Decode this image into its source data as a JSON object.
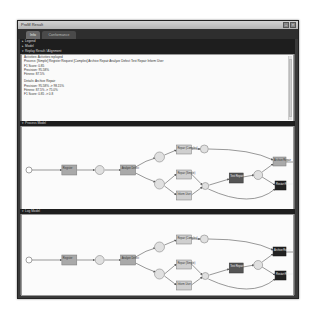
{
  "window": {
    "title": "ProM Result",
    "controls": [
      "minimize",
      "close"
    ]
  },
  "tabs": [
    {
      "label": "Info",
      "active": true
    },
    {
      "label": "Conformance Checking",
      "active": false
    }
  ],
  "sections": {
    "legend": "Legend",
    "model": "Model",
    "report": "Replay Result / Alignment",
    "process_model": "Process Model",
    "log_model": "Log Model"
  },
  "report_lines": [
    "Activities: Activities replayed",
    "Process: [Simple] Register Request [Complex] Archive Repair Analyze Defect Test Repair Inform User",
    "F1 Score: 0.85",
    "Precision: 95.58%",
    "Fitness: 87.5%",
    "",
    "Details: Archive Repair",
    "Precision: 95.58% -> 98.15%",
    "Fitness: 87.5% -> 75.0%",
    "F1 Score: 0.85 -> 0.8"
  ],
  "process_model": {
    "transitions": [
      {
        "id": "t1",
        "label": "Register"
      },
      {
        "id": "t2",
        "label": "Analyze Defect"
      },
      {
        "id": "t3",
        "label": "Repair (Complex)"
      },
      {
        "id": "t4",
        "label": "Repair (Simple)"
      },
      {
        "id": "t5",
        "label": "Inform User"
      },
      {
        "id": "t6",
        "label": "Test Repair"
      },
      {
        "id": "t7",
        "label": "Archive Repair"
      },
      {
        "id": "t8",
        "label": "Restart Repair"
      }
    ]
  },
  "log_model": {
    "transitions": [
      {
        "id": "t1",
        "label": "Register"
      },
      {
        "id": "t2",
        "label": "Analyze Defect"
      },
      {
        "id": "t3",
        "label": "Repair (Complex)"
      },
      {
        "id": "t4",
        "label": "Repair (Simple)"
      },
      {
        "id": "t5",
        "label": "Inform User"
      },
      {
        "id": "t6",
        "label": "Test Repair"
      },
      {
        "id": "t7",
        "label": "Archive Repair"
      },
      {
        "id": "t8",
        "label": "Restart Repair"
      }
    ]
  }
}
